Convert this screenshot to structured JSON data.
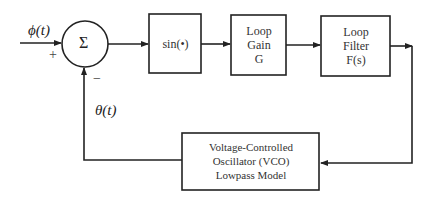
{
  "diagram": {
    "type": "block-diagram",
    "title": "",
    "input_signal": "ϕ(t)",
    "feedback_signal": "θ(t)",
    "summing_junction": {
      "symbol": "Σ",
      "plus_sign": "+",
      "minus_sign": "−"
    },
    "blocks": [
      {
        "id": "sin",
        "lines": [
          "sin(•)"
        ]
      },
      {
        "id": "loop-gain",
        "lines": [
          "Loop",
          "Gain",
          "G"
        ]
      },
      {
        "id": "loop-filter",
        "lines": [
          "Loop",
          "Filter",
          "F(s)"
        ]
      },
      {
        "id": "vco",
        "lines": [
          "Voltage-Controlled",
          "Oscillator (VCO)",
          "Lowpass Model"
        ]
      }
    ],
    "connections": [
      {
        "from": "input",
        "to": "summing_junction",
        "sign": "+"
      },
      {
        "from": "summing_junction",
        "to": "sin"
      },
      {
        "from": "sin",
        "to": "loop-gain"
      },
      {
        "from": "loop-gain",
        "to": "loop-filter"
      },
      {
        "from": "loop-filter",
        "to": "vco"
      },
      {
        "from": "vco",
        "to": "summing_junction",
        "sign": "−",
        "label": "θ(t)"
      }
    ]
  }
}
